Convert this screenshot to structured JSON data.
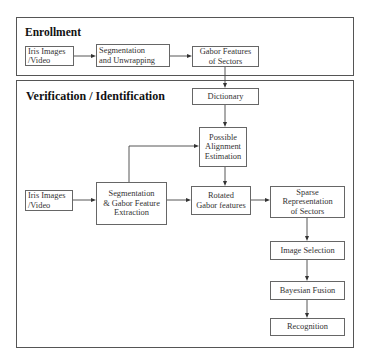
{
  "enrollment": {
    "title": "Enrollment",
    "steps": {
      "iris": "Iris Images\n /Video",
      "segmentation": "Segmentation\nand Unwrapping",
      "gabor": "Gabor Features\nof Sectors"
    }
  },
  "verification": {
    "title": "Verification / Identification",
    "steps": {
      "dictionary": "Dictionary",
      "alignment": "Possible\nAlignment\nEstimation",
      "iris": "Iris Images\n/Video",
      "segmentation": "Segmentation\n& Gabor Feature\nExtraction",
      "rotated": "Rotated\nGabor features",
      "sparse": "Sparse\nRepresentation\nof Sectors",
      "image_selection": "Image Selection",
      "bayesian": "Bayesian Fusion",
      "recognition": "Recognition"
    }
  }
}
